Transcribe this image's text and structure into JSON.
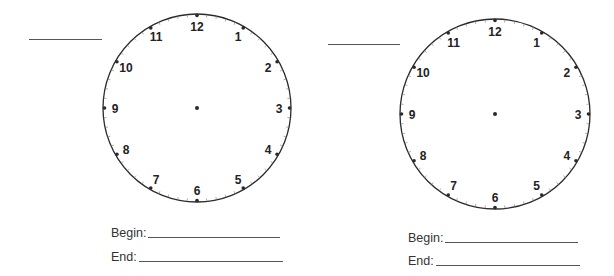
{
  "worksheet": {
    "side_text": "",
    "clocks": [
      {
        "id": "clock-1",
        "name_line": {
          "x": 29,
          "y": 39,
          "width": 73
        },
        "center": {
          "x": 197,
          "y": 108
        },
        "radius": 94,
        "numbers": [
          "12",
          "1",
          "2",
          "3",
          "4",
          "5",
          "6",
          "7",
          "8",
          "9",
          "10",
          "11"
        ],
        "begin_label": "Begin:",
        "begin_value": "",
        "end_label": "End:",
        "end_value": "",
        "begin_pos": {
          "x": 111,
          "y": 226,
          "line_width": 132
        },
        "end_pos": {
          "x": 111,
          "y": 250,
          "line_width": 144
        }
      },
      {
        "id": "clock-2",
        "name_line": {
          "x": 328,
          "y": 44,
          "width": 72
        },
        "center": {
          "x": 495,
          "y": 114
        },
        "radius": 95,
        "numbers": [
          "12",
          "1",
          "2",
          "3",
          "4",
          "5",
          "6",
          "7",
          "8",
          "9",
          "10",
          "11"
        ],
        "begin_label": "Begin:",
        "begin_value": "",
        "end_label": "End:",
        "end_value": "",
        "begin_pos": {
          "x": 408,
          "y": 231,
          "line_width": 133
        },
        "end_pos": {
          "x": 408,
          "y": 254,
          "line_width": 144
        }
      }
    ],
    "colors": {
      "stroke": "#2a2a2a",
      "text": "#222222",
      "blank_line": "#555555"
    }
  }
}
